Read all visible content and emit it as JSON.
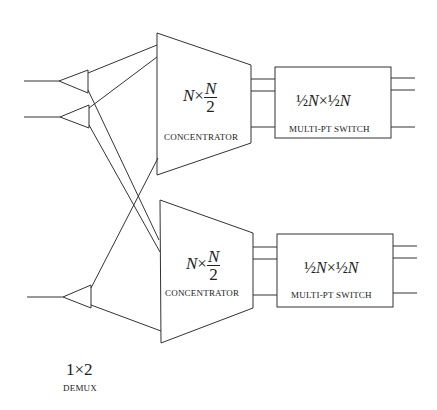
{
  "diagram": {
    "concentrators": [
      {
        "label_lhs": "N",
        "times": "×",
        "frac_num": "N",
        "frac_den": "2",
        "caption": "CONCENTRATOR"
      },
      {
        "label_lhs": "N",
        "times": "×",
        "frac_num": "N",
        "frac_den": "2",
        "caption": "CONCENTRATOR"
      }
    ],
    "switches": [
      {
        "half": "½",
        "n": "N",
        "times": "×",
        "caption": "MULTI-PT SWITCH"
      },
      {
        "half": "½",
        "n": "N",
        "times": "×",
        "caption": "MULTI-PT SWITCH"
      }
    ],
    "demux": {
      "label": "1×2",
      "caption": "DEMUX"
    },
    "colors": {
      "stroke": "#333333",
      "background": "#ffffff"
    }
  }
}
